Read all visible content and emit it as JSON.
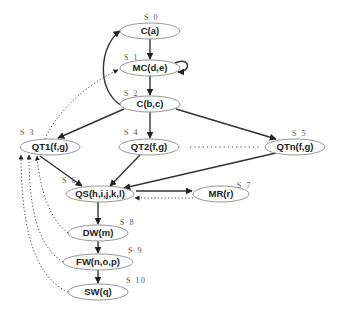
{
  "diagram": {
    "nodes": [
      {
        "id": "n0",
        "label": "C(a)",
        "state": "S 0"
      },
      {
        "id": "n1",
        "label": "MC(d,e)",
        "state": "S 1"
      },
      {
        "id": "n2",
        "label": "C(b,c)",
        "state": "S 2"
      },
      {
        "id": "n3",
        "label": "QT1(f,g)",
        "state": "S 3"
      },
      {
        "id": "n4",
        "label": "QT2(f,g)",
        "state": "S 4"
      },
      {
        "id": "n5",
        "label": "QTn(f,g)",
        "state": "S 5"
      },
      {
        "id": "n6",
        "label": "QS(h,i,j,k,l)",
        "state": "S 6"
      },
      {
        "id": "n7",
        "label": "MR(r)",
        "state": "S 7"
      },
      {
        "id": "n8",
        "label": "DW(m)",
        "state": "S 8"
      },
      {
        "id": "n9",
        "label": "FW(n,o,p)",
        "state": "S 9"
      },
      {
        "id": "n10",
        "label": "SW(q)",
        "state": "S 10"
      }
    ],
    "edges": [
      {
        "from": "n0",
        "to": "n1",
        "style": "solid"
      },
      {
        "from": "n1",
        "to": "n1",
        "style": "solid",
        "kind": "self-loop"
      },
      {
        "from": "n1",
        "to": "n2",
        "style": "solid"
      },
      {
        "from": "n2",
        "to": "n0",
        "style": "solid"
      },
      {
        "from": "n2",
        "to": "n3",
        "style": "solid"
      },
      {
        "from": "n2",
        "to": "n4",
        "style": "solid"
      },
      {
        "from": "n2",
        "to": "n5",
        "style": "solid"
      },
      {
        "from": "n3",
        "to": "n1",
        "style": "dotted"
      },
      {
        "from": "n3",
        "to": "n6",
        "style": "solid"
      },
      {
        "from": "n4",
        "to": "n6",
        "style": "solid"
      },
      {
        "from": "n5",
        "to": "n6",
        "style": "solid"
      },
      {
        "from": "n6",
        "to": "n7",
        "style": "solid"
      },
      {
        "from": "n7",
        "to": "n6",
        "style": "dotted"
      },
      {
        "from": "n6",
        "to": "n8",
        "style": "solid"
      },
      {
        "from": "n8",
        "to": "n9",
        "style": "solid"
      },
      {
        "from": "n9",
        "to": "n10",
        "style": "solid"
      },
      {
        "from": "n8",
        "to": "n3",
        "style": "dotted"
      },
      {
        "from": "n9",
        "to": "n3",
        "style": "dotted"
      },
      {
        "from": "n10",
        "to": "n3",
        "style": "dotted"
      }
    ],
    "ellipsis_between": [
      "n4",
      "n5"
    ]
  }
}
